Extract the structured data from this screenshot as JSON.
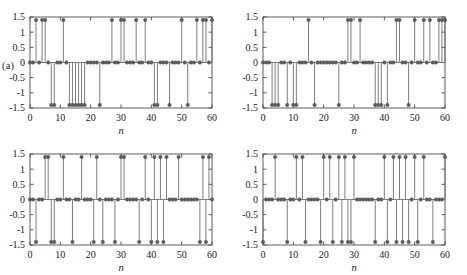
{
  "figure": {
    "background": "#ffffff",
    "line_color": "#6f6f6f",
    "marker_color": "#5a5a5a",
    "axis_color": "#4a4a4a",
    "text_color": "#1a1a1a"
  },
  "panel_tags": {
    "a": "(a)",
    "b": "(b)"
  },
  "axes": {
    "xlabel": "n",
    "xticks": [
      "0",
      "10",
      "20",
      "30",
      "40",
      "50",
      "60"
    ],
    "xtick_values": [
      0,
      10,
      20,
      30,
      40,
      50,
      60
    ],
    "yticks": [
      "1.5",
      "1",
      "0.5",
      "0",
      "-0.5",
      "-1",
      "-1.5"
    ],
    "ytick_values": [
      1.5,
      1,
      0.5,
      0,
      -0.5,
      -1,
      -1.5
    ],
    "xlim": [
      0,
      60
    ],
    "ylim": [
      -1.5,
      1.5
    ],
    "grid": false
  },
  "chart_data": [
    {
      "id": "panel-a-left",
      "type": "line",
      "subtype": "stem",
      "title": "",
      "xlabel": "n",
      "ylabel": "",
      "xlim": [
        0,
        60
      ],
      "ylim": [
        -1.5,
        1.5
      ],
      "grid": false,
      "amplitude": 1.4,
      "x": [
        0,
        1,
        2,
        3,
        4,
        5,
        6,
        7,
        8,
        9,
        10,
        11,
        12,
        13,
        14,
        15,
        16,
        17,
        18,
        19,
        20,
        21,
        22,
        23,
        24,
        25,
        26,
        27,
        28,
        29,
        30,
        31,
        32,
        33,
        34,
        35,
        36,
        37,
        38,
        39,
        40,
        41,
        42,
        43,
        44,
        45,
        46,
        47,
        48,
        49,
        50,
        51,
        52,
        53,
        54,
        55,
        56,
        57,
        58,
        59,
        60
      ],
      "values": [
        0,
        0,
        1.4,
        0,
        1.4,
        1.4,
        0,
        -1.4,
        -1.4,
        0,
        0,
        1.4,
        0,
        -1.4,
        -1.4,
        -1.4,
        -1.4,
        -1.4,
        -1.4,
        0,
        0,
        0,
        0,
        -1.4,
        0,
        0,
        0,
        1.4,
        0,
        0,
        1.4,
        1.4,
        0,
        0,
        0,
        1.4,
        0,
        0,
        1.4,
        0,
        0,
        -1.4,
        -1.4,
        0,
        0,
        0,
        -1.4,
        0,
        0,
        0,
        1.4,
        0,
        -1.4,
        0,
        0,
        1.4,
        0,
        1.4,
        1.4,
        0,
        1.4
      ]
    },
    {
      "id": "panel-a-right",
      "type": "line",
      "subtype": "stem",
      "title": "",
      "xlabel": "n",
      "ylabel": "",
      "xlim": [
        0,
        60
      ],
      "ylim": [
        -1.5,
        1.5
      ],
      "grid": false,
      "amplitude": 1.4,
      "x": [
        0,
        1,
        2,
        3,
        4,
        5,
        6,
        7,
        8,
        9,
        10,
        11,
        12,
        13,
        14,
        15,
        16,
        17,
        18,
        19,
        20,
        21,
        22,
        23,
        24,
        25,
        26,
        27,
        28,
        29,
        30,
        31,
        32,
        33,
        34,
        35,
        36,
        37,
        38,
        39,
        40,
        41,
        42,
        43,
        44,
        45,
        46,
        47,
        48,
        49,
        50,
        51,
        52,
        53,
        54,
        55,
        56,
        57,
        58,
        59,
        60
      ],
      "values": [
        0,
        0,
        0,
        -1.4,
        -1.4,
        -1.4,
        0,
        0,
        -1.4,
        0,
        -1.4,
        -1.4,
        0,
        0,
        0,
        1.4,
        0,
        -1.4,
        0,
        0,
        0,
        0,
        0,
        0,
        0,
        -1.4,
        0,
        0,
        1.4,
        1.4,
        0,
        0,
        1.4,
        0,
        0,
        0,
        0,
        -1.4,
        -1.4,
        -1.4,
        0,
        -1.4,
        0,
        0,
        1.4,
        1.4,
        0,
        0,
        -1.4,
        0,
        1.4,
        0,
        0,
        1.4,
        0,
        1.4,
        0,
        0,
        1.4,
        1.4,
        1.4
      ]
    },
    {
      "id": "panel-b-left",
      "type": "line",
      "subtype": "stem",
      "title": "",
      "xlabel": "n",
      "ylabel": "",
      "xlim": [
        0,
        60
      ],
      "ylim": [
        -1.5,
        1.5
      ],
      "grid": false,
      "amplitude": 1.4,
      "x": [
        0,
        1,
        2,
        3,
        4,
        5,
        6,
        7,
        8,
        9,
        10,
        11,
        12,
        13,
        14,
        15,
        16,
        17,
        18,
        19,
        20,
        21,
        22,
        23,
        24,
        25,
        26,
        27,
        28,
        29,
        30,
        31,
        32,
        33,
        34,
        35,
        36,
        37,
        38,
        39,
        40,
        41,
        42,
        43,
        44,
        45,
        46,
        47,
        48,
        49,
        50,
        51,
        52,
        53,
        54,
        55,
        56,
        57,
        58,
        59,
        60
      ],
      "values": [
        0,
        0,
        -1.4,
        0,
        0,
        1.4,
        1.4,
        -1.4,
        -1.4,
        0,
        0,
        1.4,
        0,
        0,
        -1.4,
        0,
        0,
        1.4,
        0,
        0,
        0,
        -1.4,
        1.4,
        0,
        -1.4,
        0,
        0,
        0,
        -1.4,
        0,
        1.4,
        1.4,
        0,
        0,
        0,
        0,
        -1.4,
        0,
        1.4,
        0,
        -1.4,
        1.4,
        -1.4,
        1.4,
        -1.4,
        1.4,
        0,
        0,
        0,
        1.4,
        0,
        0,
        0,
        0,
        0,
        0,
        -1.4,
        1.4,
        -1.4,
        1.4,
        0
      ]
    },
    {
      "id": "panel-b-right",
      "type": "line",
      "subtype": "stem",
      "title": "",
      "xlabel": "n",
      "ylabel": "",
      "xlim": [
        0,
        60
      ],
      "ylim": [
        -1.5,
        1.5
      ],
      "grid": false,
      "amplitude": 1.4,
      "x": [
        0,
        1,
        2,
        3,
        4,
        5,
        6,
        7,
        8,
        9,
        10,
        11,
        12,
        13,
        14,
        15,
        16,
        17,
        18,
        19,
        20,
        21,
        22,
        23,
        24,
        25,
        26,
        27,
        28,
        29,
        30,
        31,
        32,
        33,
        34,
        35,
        36,
        37,
        38,
        39,
        40,
        41,
        42,
        43,
        44,
        45,
        46,
        47,
        48,
        49,
        50,
        51,
        52,
        53,
        54,
        55,
        56,
        57,
        58,
        59,
        60
      ],
      "values": [
        -1.4,
        0,
        0,
        0,
        1.4,
        0,
        0,
        0,
        -1.4,
        0,
        0,
        1.4,
        0,
        1.4,
        -1.4,
        0,
        0,
        0,
        0,
        -1.4,
        1.4,
        0,
        1.4,
        -1.4,
        0,
        1.4,
        -1.4,
        1.4,
        -1.4,
        -1.4,
        1.4,
        0,
        0,
        0,
        0,
        0,
        0,
        -1.4,
        0,
        0,
        1.4,
        -1.4,
        0,
        1.4,
        -1.4,
        1.4,
        -1.4,
        1.4,
        -1.4,
        0,
        1.4,
        -1.4,
        0,
        1.4,
        0,
        0,
        -1.4,
        0,
        0,
        0,
        1.4
      ]
    }
  ]
}
